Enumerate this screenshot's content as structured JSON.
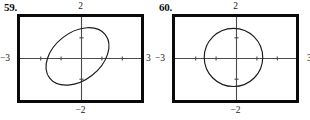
{
  "page": {
    "background": "#ffffff",
    "figure_count": 2
  },
  "figures": [
    {
      "id": "59",
      "number_label": "59.",
      "labels": {
        "top": "2",
        "bottom": "−2",
        "left": "−3",
        "right": "3"
      },
      "chart_data": {
        "type": "line",
        "title": "",
        "subtitle": "",
        "xlabel": "",
        "ylabel": "",
        "grid": false,
        "legend": "none",
        "xlim": [
          -3,
          3
        ],
        "ylim": [
          -2,
          2
        ],
        "xticks": [
          -3,
          -2,
          -1,
          0,
          1,
          2,
          3
        ],
        "yticks": [
          -2,
          -1,
          0,
          1,
          2
        ],
        "curve_name": "rotated-ellipse",
        "description": "Tilted ellipse centered near the origin, major axis sloping down to the right",
        "ellipse": {
          "center_x": -0.15,
          "center_y": 0.1,
          "semi_major": 1.75,
          "semi_minor": 1.15,
          "rotation_deg": -38
        }
      }
    },
    {
      "id": "60",
      "number_label": "60.",
      "labels": {
        "top": "2",
        "bottom": "−2",
        "left": "−3",
        "right": "3"
      },
      "chart_data": {
        "type": "line",
        "title": "",
        "subtitle": "",
        "xlabel": "",
        "ylabel": "",
        "grid": false,
        "legend": "none",
        "xlim": [
          -3,
          3
        ],
        "ylim": [
          -2,
          2
        ],
        "xticks": [
          -3,
          -2,
          -1,
          0,
          1,
          2,
          3
        ],
        "yticks": [
          -2,
          -1,
          0,
          1,
          2
        ],
        "curve_name": "circle",
        "description": "Near-circular closed curve centered slightly left of the origin",
        "ellipse": {
          "center_x": -0.1,
          "center_y": 0.05,
          "semi_major": 1.45,
          "semi_minor": 1.4,
          "rotation_deg": 0
        }
      }
    }
  ],
  "style": {
    "frame_color": "#0a0a0a",
    "axis_color": "#4a4a4a",
    "curve_color": "#1a1a1a",
    "text_color": "#1a1a1a"
  }
}
